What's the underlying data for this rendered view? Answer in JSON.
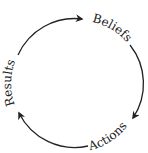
{
  "diagram": {
    "type": "cycle",
    "nodes": [
      {
        "id": "beliefs",
        "label": "Beliefs"
      },
      {
        "id": "actions",
        "label": "Actions"
      },
      {
        "id": "results",
        "label": "Results"
      }
    ],
    "edges": [
      {
        "from": "beliefs",
        "to": "actions"
      },
      {
        "from": "actions",
        "to": "results"
      },
      {
        "from": "results",
        "to": "beliefs"
      }
    ],
    "colors": {
      "stroke": "#222222",
      "text": "#333333",
      "background": "#ffffff"
    }
  }
}
